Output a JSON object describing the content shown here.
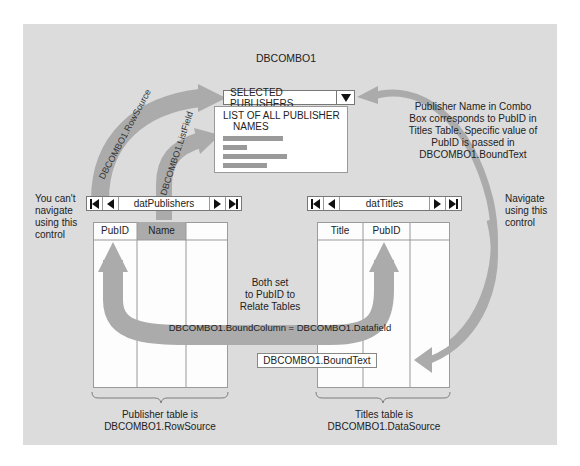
{
  "combo": {
    "title": "DBCOMBO1",
    "selected_value": "SELECTED PUBLISHERS",
    "list_header_line1": "LIST OF ALL PUBLISHER",
    "list_header_line2": "NAMES",
    "list_bar_widths": [
      60,
      24,
      64,
      44
    ]
  },
  "arrows": {
    "rowsource": "DBCOMBO1.RowSource",
    "listfield": "DBCOMBO1.ListField",
    "bound_column": "DBCOMBO1.BoundColumn = DBCOMBO1.Datafield"
  },
  "annotations": {
    "cant_navigate": [
      "You can't",
      "navigate",
      "using this",
      "control"
    ],
    "navigate": [
      "Navigate",
      "using this",
      "control"
    ],
    "bound_text_note": [
      "Publisher Name in Combo",
      "Box corresponds to PubID in",
      "Titles Table. Specific value of",
      "PubID is passed in",
      "DBCOMBO1.BoundText"
    ],
    "both_set": [
      "Both set",
      "to PubID to",
      "Relate Tables"
    ],
    "publisher_table": [
      "Publisher table is",
      "DBCOMBO1.RowSource"
    ],
    "titles_table": [
      "Titles table is",
      "DBCOMBO1.DataSource"
    ]
  },
  "publishers_control": {
    "caption": "datPublishers",
    "columns": [
      "PubID",
      "Name",
      ""
    ]
  },
  "titles_control": {
    "caption": "datTitles",
    "columns": [
      "Title",
      "PubID",
      ""
    ]
  },
  "bound_text_box": "DBCOMBO1.BoundText",
  "colors": {
    "panel": "#dcdcdc",
    "arrow": "#a9a9a9",
    "highlight_column": "#a9a9a9"
  }
}
